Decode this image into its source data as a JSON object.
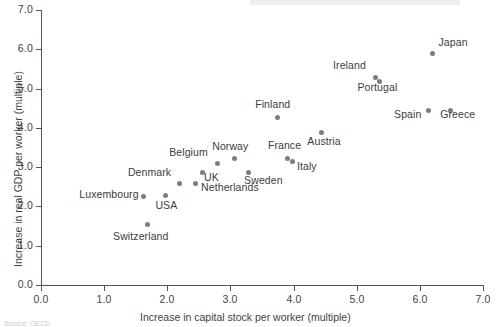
{
  "chart_data": {
    "type": "scatter",
    "title": "",
    "xlabel": "Increase in capital stock per worker (multiple)",
    "ylabel": "Increase in real GDP per worker (multiple)",
    "xlim": [
      0.0,
      7.0
    ],
    "ylim": [
      0.0,
      7.0
    ],
    "xticks": [
      "0.0",
      "1.0",
      "2.0",
      "3.0",
      "4.0",
      "5.0",
      "6.0",
      "7.0"
    ],
    "yticks": [
      "0.0",
      "1.0",
      "2.0",
      "3.0",
      "4.0",
      "5.0",
      "6.0",
      "7.0"
    ],
    "grid": false,
    "legend": "none",
    "marker_color": "#7d7d7d",
    "axis_color": "#555555",
    "points": [
      {
        "label": "Switzerland",
        "x": 1.68,
        "y": 1.55,
        "lx": -34,
        "ly": 12
      },
      {
        "label": "Luxembourg",
        "x": 1.62,
        "y": 2.26,
        "lx": -64,
        "ly": -2
      },
      {
        "label": "USA",
        "x": 1.97,
        "y": 2.29,
        "lx": -10,
        "ly": 10
      },
      {
        "label": "Denmark",
        "x": 2.2,
        "y": 2.59,
        "lx": -52,
        "ly": -11
      },
      {
        "label": "Netherlands",
        "x": 2.44,
        "y": 2.59,
        "lx": 6,
        "ly": 4
      },
      {
        "label": "UK",
        "x": 2.55,
        "y": 2.87,
        "lx": 2,
        "ly": 5
      },
      {
        "label": "Belgium",
        "x": 2.79,
        "y": 3.1,
        "lx": -48,
        "ly": -11
      },
      {
        "label": "Norway",
        "x": 3.06,
        "y": 3.23,
        "lx": -22,
        "ly": -12
      },
      {
        "label": "Sweden",
        "x": 3.28,
        "y": 2.87,
        "lx": -4,
        "ly": 8
      },
      {
        "label": "Finland",
        "x": 3.74,
        "y": 4.27,
        "lx": -22,
        "ly": -13
      },
      {
        "label": "France",
        "x": 3.91,
        "y": 3.23,
        "lx": -20,
        "ly": -13
      },
      {
        "label": "Italy",
        "x": 3.99,
        "y": 3.15,
        "lx": 4,
        "ly": 5
      },
      {
        "label": "Austria",
        "x": 4.44,
        "y": 3.87,
        "lx": -14,
        "ly": 8
      },
      {
        "label": "Ireland",
        "x": 5.29,
        "y": 5.29,
        "lx": -42,
        "ly": -12
      },
      {
        "label": "Portugal",
        "x": 5.36,
        "y": 5.19,
        "lx": -22,
        "ly": 6
      },
      {
        "label": "Spain",
        "x": 6.13,
        "y": 4.45,
        "lx": -34,
        "ly": 4
      },
      {
        "label": "Greece",
        "x": 6.48,
        "y": 4.45,
        "lx": -10,
        "ly": 4
      },
      {
        "label": "Japan",
        "x": 6.2,
        "y": 5.9,
        "lx": 6,
        "ly": -11
      }
    ]
  },
  "footer": {
    "sliver_text": "Source: OECD"
  }
}
